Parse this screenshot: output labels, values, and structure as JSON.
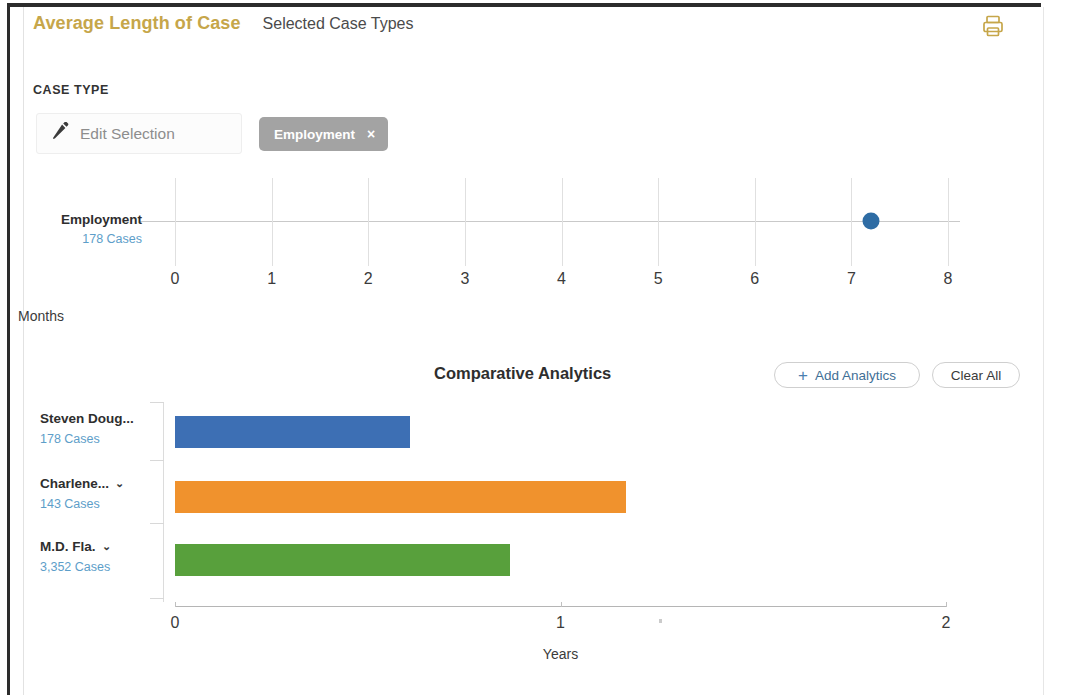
{
  "header": {
    "title": "Average Length of Case",
    "subtitle": "Selected Case Types",
    "print_icon": "print-icon"
  },
  "case_type": {
    "section_label": "CASE TYPE",
    "edit_label": "Edit Selection",
    "edit_icon": "pencil-icon",
    "chips": [
      {
        "label": "Employment",
        "remove": "×"
      }
    ]
  },
  "comparative": {
    "title": "Comparative Analytics",
    "add_label": "Add Analytics",
    "add_icon": "plus-icon",
    "clear_label": "Clear All"
  },
  "colors": {
    "brand_gold": "#c6a64a",
    "link_blue": "#5d9ec9",
    "chip_gray": "#a3a3a3",
    "dot_blue": "#2e6ca4",
    "bar_blue": "#3d6fb4",
    "bar_orange": "#f0922d",
    "bar_green": "#58a03c"
  },
  "chart_data": [
    {
      "type": "scatter",
      "title": "",
      "xlabel": "Months",
      "ylabel": "",
      "xlim": [
        0,
        8
      ],
      "xticks": [
        "0",
        "1",
        "2",
        "3",
        "4",
        "5",
        "6",
        "7",
        "8"
      ],
      "grid": true,
      "categories": [
        "Employment"
      ],
      "rows": [
        {
          "label": "Employment",
          "cases": "178 Cases",
          "value": 7.2,
          "color": "#2e6ca4"
        }
      ]
    },
    {
      "type": "bar",
      "title": "Comparative Analytics",
      "xlabel": "Years",
      "ylabel": "",
      "xlim": [
        0,
        2
      ],
      "xticks": [
        "0",
        "1",
        "2"
      ],
      "grid": false,
      "orientation": "horizontal",
      "categories": [
        "Steven Doug...",
        "Charlene...",
        "M.D. Fla."
      ],
      "values": [
        0.61,
        1.17,
        0.87
      ],
      "rows": [
        {
          "label": "Steven Doug...",
          "cases": "178 Cases",
          "value": 0.61,
          "color": "#3d6fb4",
          "caret": false
        },
        {
          "label": "Charlene...",
          "cases": "143 Cases",
          "value": 1.17,
          "color": "#f0922d",
          "caret": true
        },
        {
          "label": "M.D. Fla.",
          "cases": "3,352 Cases",
          "value": 0.87,
          "color": "#58a03c",
          "caret": true
        }
      ]
    }
  ]
}
